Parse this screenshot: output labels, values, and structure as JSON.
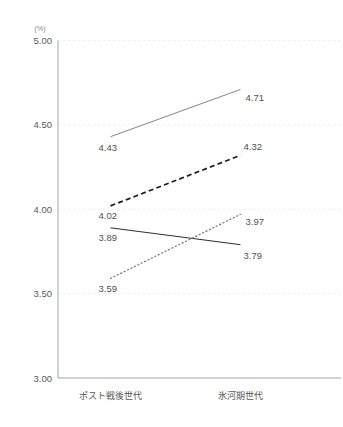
{
  "chart_data": {
    "type": "line",
    "title": "",
    "xlabel": "",
    "ylabel": "",
    "unit_label": "(%)",
    "categories": [
      "ポスト戦後世代",
      "氷河期世代"
    ],
    "ylim": [
      3.0,
      5.0
    ],
    "ytick_labels": [
      "5.00",
      "4.50",
      "4.00",
      "3.50",
      "3.00"
    ],
    "ytick_values": [
      5.0,
      4.5,
      4.0,
      3.5,
      3.0
    ],
    "grid": true,
    "grid_axis": "y",
    "legend_position": "top",
    "series": [
      {
        "name": "series-1",
        "style": "solid",
        "color": "#777777",
        "width": 0.9,
        "values": [
          4.43,
          4.71
        ],
        "labels": [
          "4.43",
          "4.71"
        ]
      },
      {
        "name": "series-2",
        "style": "dashed",
        "color": "#1c1c1c",
        "width": 1.7,
        "values": [
          4.02,
          4.32
        ],
        "labels": [
          "4.02",
          "4.32"
        ]
      },
      {
        "name": "series-3",
        "style": "solid",
        "color": "#2d2d2d",
        "width": 1.0,
        "values": [
          3.89,
          3.79
        ],
        "labels": [
          "3.89",
          "3.79"
        ]
      },
      {
        "name": "series-4",
        "style": "dotted",
        "color": "#777777",
        "width": 1.2,
        "values": [
          3.59,
          3.97
        ],
        "labels": [
          "3.59",
          "3.97"
        ]
      }
    ]
  },
  "axes": {
    "axis_line_color": "#9a9a9a",
    "grid_color": "#e8e8ec"
  },
  "legend_strip": {
    "cut_off": true,
    "items": [
      "",
      "",
      "",
      "",
      ""
    ]
  }
}
